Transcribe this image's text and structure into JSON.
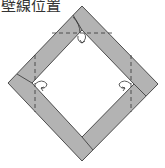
{
  "caption": {
    "text": "壁線位置",
    "note": "clipped at top edge"
  },
  "diagram": {
    "shape": "square frame rotated 45deg (diamond)",
    "colors": {
      "fill": "#b3b3b3",
      "outline": "#4d4d4d",
      "fold_line": "#333333",
      "arrow": "#333333",
      "background": "#ffffff"
    },
    "outer_vertices": {
      "top": [
        82,
        6
      ],
      "right": [
        158,
        84
      ],
      "bottom": [
        82,
        161
      ],
      "left": [
        8,
        83
      ]
    },
    "inner_vertices": {
      "top": [
        82,
        30
      ],
      "right": [
        134,
        84
      ],
      "bottom": [
        82,
        137
      ],
      "left": [
        32,
        83
      ]
    },
    "dashed_lines": [
      {
        "name": "top-horizontal-fold",
        "from": [
          52,
          33
        ],
        "to": [
          112,
          33
        ]
      },
      {
        "name": "left-vertical-fold",
        "from": [
          35,
          55
        ],
        "to": [
          35,
          112
        ]
      },
      {
        "name": "right-vertical-fold",
        "from": [
          131,
          55
        ],
        "to": [
          131,
          112
        ]
      }
    ],
    "arrows": [
      {
        "name": "top-fold-arrow",
        "direction": "down"
      },
      {
        "name": "left-fold-arrow",
        "direction": "right"
      },
      {
        "name": "right-fold-arrow",
        "direction": "left"
      }
    ]
  }
}
